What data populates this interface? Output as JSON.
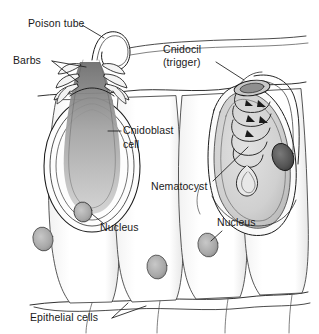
{
  "figure": {
    "background_color": "#ffffff",
    "ink_color": "#1a1a1a",
    "stipple_color": "#9a9a9a"
  },
  "labels": {
    "poison_tube": "Poison tube",
    "barbs": "Barbs",
    "cnidocil_line1": "Cnidocil",
    "cnidocil_line2": "(trigger)",
    "cnidoblast_line1": "Cnidoblast",
    "cnidoblast_line2": "cell",
    "nematocyst": "Nematocyst",
    "nucleus_left": "Nucleus",
    "nucleus_right": "Nucleus",
    "epithelial_cells": "Epithelial cells"
  }
}
